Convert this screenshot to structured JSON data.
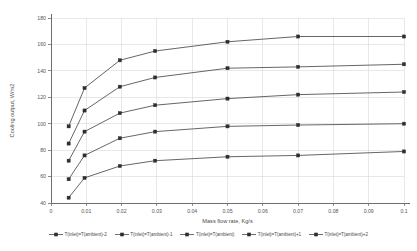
{
  "chart_data": {
    "type": "line",
    "title": "",
    "xlabel": "Mass flow rate, Kg/s",
    "ylabel": "Cooling output, W/m2",
    "xlim": [
      0,
      0.1
    ],
    "ylim": [
      40,
      180
    ],
    "xticks": [
      0,
      0.01,
      0.02,
      0.03,
      0.04,
      0.05,
      0.06,
      0.07,
      0.08,
      0.09,
      0.1
    ],
    "xtick_labels": [
      "0",
      "0.01",
      "0.02",
      "0.03",
      "0.04",
      "0.05",
      "0.06",
      "0.07",
      "0.08",
      "0.09",
      "0.1"
    ],
    "yticks": [
      40,
      60,
      80,
      100,
      120,
      140,
      160,
      180
    ],
    "ytick_labels": [
      "40",
      "60",
      "80",
      "100",
      "120",
      "140",
      "160",
      "180"
    ],
    "grid": true,
    "legend_position": "bottom",
    "marker": "square",
    "x": [
      0.005,
      0.0095,
      0.0195,
      0.0295,
      0.05,
      0.07,
      0.1
    ],
    "series": [
      {
        "name": "T(inlet)=T(ambient)-2",
        "values": [
          98,
          127,
          148,
          155,
          162,
          166,
          166
        ]
      },
      {
        "name": "T(inlet)=T(ambient)-1",
        "values": [
          85,
          110,
          128,
          135,
          142,
          143,
          145
        ]
      },
      {
        "name": "T(inlet)=T(ambient)",
        "values": [
          72,
          94,
          108,
          114,
          119,
          122,
          124
        ]
      },
      {
        "name": "T(inlet)=T(ambient)+1",
        "values": [
          58,
          76,
          89,
          94,
          98,
          99,
          100
        ]
      },
      {
        "name": "T(inlet)=T(ambient)+2",
        "values": [
          44,
          59,
          68,
          72,
          75,
          76,
          79
        ]
      }
    ]
  },
  "colors": {
    "axis": "#6e6e6e",
    "grid": "#d8d8d8",
    "series_line": "#4a4a4a",
    "marker": "#2e2e2e",
    "background": "#ffffff"
  }
}
